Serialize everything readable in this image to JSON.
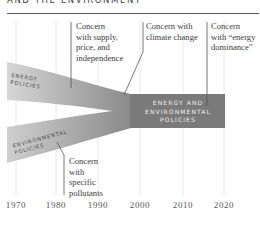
{
  "title": "AND THE ENVIRONMENT",
  "bands": {
    "energy": {
      "label_line1": "ENERGY",
      "label_line2": "POLICIES",
      "color": "#c8c8c8"
    },
    "environmental": {
      "label_line1": "ENVIRONMENTAL",
      "label_line2": "POLICIES",
      "color": "#bdbdbd"
    },
    "merged": {
      "label_line1": "ENERGY AND",
      "label_line2": "ENVIRONMENTAL",
      "label_line3": "POLICIES",
      "color": "#7a7a7a"
    }
  },
  "annotations": [
    {
      "id": "supply",
      "lines": [
        "Concern",
        "with supply,",
        "price, and",
        "independence"
      ]
    },
    {
      "id": "climate",
      "lines": [
        "Concern with",
        "climate change"
      ]
    },
    {
      "id": "dominance",
      "lines": [
        "Concern",
        "with “energy",
        "dominance”"
      ]
    },
    {
      "id": "pollutants",
      "lines": [
        "Concern",
        "with",
        "specific",
        "pollutants"
      ]
    }
  ],
  "axis": {
    "years": [
      "1970",
      "1980",
      "1990",
      "2000",
      "2010",
      "2020"
    ]
  }
}
